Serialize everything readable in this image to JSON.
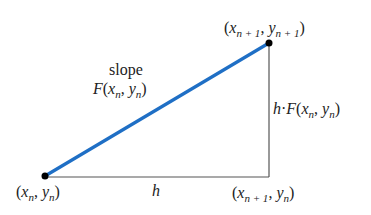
{
  "diagram": {
    "colors": {
      "secant": "#1f6fc5",
      "legs": "#555555",
      "point": "#000000",
      "text": "#222222"
    },
    "points": {
      "start": {
        "x": 45,
        "y": 176,
        "label": {
          "x": "x",
          "xsub": "n",
          "y": "y",
          "ysub": "n"
        }
      },
      "end": {
        "x": 269,
        "y": 43,
        "label": {
          "x": "x",
          "xsub": "n + 1",
          "y": "y",
          "ysub": "n + 1"
        }
      },
      "corner": {
        "x": 269,
        "y": 177,
        "label": {
          "x": "x",
          "xsub": "n + 1",
          "y": "y",
          "ysub": "n"
        }
      }
    },
    "labels": {
      "slope_word": "slope",
      "slope_F": "F",
      "slope_x": "x",
      "slope_xsub": "n",
      "slope_y": "y",
      "slope_ysub": "n",
      "horizontal": "h",
      "vertical_h": "h",
      "vertical_dot": "·",
      "vertical_F": "F",
      "vertical_x": "x",
      "vertical_xsub": "n",
      "vertical_y": "y",
      "vertical_ysub": "n",
      "open": "(",
      "comma": ", ",
      "close": ")"
    }
  }
}
